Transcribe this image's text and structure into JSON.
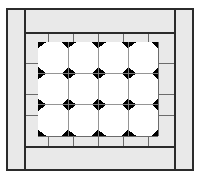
{
  "figure": {
    "name": "quilt-block-diagram",
    "canvas": {
      "width": 200,
      "height": 178
    },
    "colors": {
      "background": "#ffffff",
      "border_fill": "#e9e9e9",
      "line": "#2b2b2b",
      "line_light": "#6b6b6b",
      "patch_light": "#ffffff",
      "patch_dark": "#000000"
    }
  },
  "outer_frame": {
    "label": "outer-frame",
    "x": 7,
    "y": 9,
    "width": 186,
    "height": 161,
    "stroke_width": 1.6
  },
  "rails": {
    "label": "corner-rails",
    "vertical_x": [
      25,
      175
    ],
    "horizontal_y": [
      33,
      147
    ],
    "stroke_width": 1.3
  },
  "inner_frame": {
    "label": "inner-border-frame",
    "x": 25,
    "y": 33,
    "width": 150,
    "height": 114,
    "stroke_width": 1.3
  },
  "border_grid": {
    "label": "border-segment-grid",
    "vertical_x": [
      48,
      73,
      98,
      123,
      148
    ],
    "horizontal_y": [
      42,
      136
    ],
    "stroke_width": 1.1
  },
  "center_panel": {
    "label": "center-patchwork-panel",
    "x": 38,
    "y": 42,
    "width": 120,
    "height": 94,
    "columns": 4,
    "rows": 3,
    "cell_width": 30,
    "cell_height": 31.33,
    "corner_cut": 8.2,
    "seam_stroke": 0.9,
    "seam_color": "#8a8a8a"
  },
  "legend": {
    "patch_octagon": "white octagon patch",
    "patch_diamond": "black diamond patch",
    "border_band": "plain gray border band"
  }
}
